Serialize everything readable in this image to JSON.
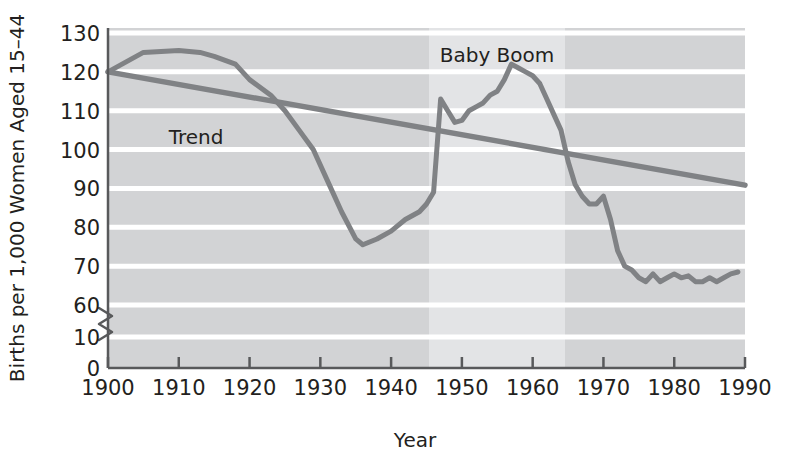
{
  "chart_data": {
    "type": "line",
    "title": "",
    "xlabel": "Year",
    "ylabel": "Births per 1,000 Women Aged 15–44",
    "xlim": [
      1900,
      1990
    ],
    "ylim": [
      0,
      130
    ],
    "y_axis_break": {
      "present": true,
      "between": [
        10,
        60
      ],
      "note": "zigzag break on y-axis"
    },
    "xticks": [
      1900,
      1910,
      1920,
      1930,
      1940,
      1950,
      1960,
      1970,
      1980,
      1990
    ],
    "xtick_labels": [
      "1900",
      "1910",
      "1920",
      "1930",
      "1940",
      "1950",
      "1960",
      "1970",
      "1980",
      "1990"
    ],
    "yticks": [
      0,
      10,
      60,
      70,
      80,
      90,
      100,
      110,
      120,
      130
    ],
    "ytick_labels": [
      "0",
      "10",
      "60",
      "70",
      "80",
      "90",
      "100",
      "110",
      "120",
      "130"
    ],
    "grid": "horizontal-white-lines",
    "legend": "none",
    "plot_background": "#d2d3d5",
    "band_background": "#e0e1e3",
    "line_color": "#808285",
    "annotations": [
      {
        "text": "Baby Boom",
        "x": 1955,
        "y": 128,
        "name": "baby-boom-label"
      },
      {
        "text": "Trend",
        "x": 1917,
        "y": 103,
        "name": "trend-label"
      }
    ],
    "shaded_region": {
      "name": "baby-boom-band",
      "x_start": 1946,
      "x_end": 1964,
      "color": "#e0e1e3"
    },
    "series": [
      {
        "name": "Birth rate",
        "color": "#808285",
        "x": [
          1900,
          1905,
          1910,
          1913,
          1915,
          1918,
          1920,
          1923,
          1925,
          1927,
          1929,
          1931,
          1933,
          1935,
          1936,
          1938,
          1940,
          1942,
          1944,
          1945,
          1946,
          1947,
          1948,
          1949,
          1950,
          1951,
          1952,
          1953,
          1954,
          1955,
          1956,
          1957,
          1958,
          1959,
          1960,
          1961,
          1962,
          1963,
          1964,
          1965,
          1966,
          1967,
          1968,
          1969,
          1970,
          1971,
          1972,
          1973,
          1974,
          1975,
          1976,
          1977,
          1978,
          1979,
          1980,
          1981,
          1982,
          1983,
          1984,
          1985,
          1986,
          1987,
          1988,
          1989
        ],
        "y": [
          120,
          125,
          125.5,
          125,
          124,
          122,
          118,
          114,
          110,
          105,
          100,
          92,
          84,
          77,
          75.5,
          77,
          79,
          82,
          84,
          86,
          89,
          113,
          110,
          107,
          107.5,
          110,
          111,
          112,
          114,
          115,
          118,
          122,
          121,
          120,
          119,
          117,
          113,
          109,
          105,
          97,
          91,
          88,
          86,
          86,
          88,
          82,
          74,
          70,
          69,
          67,
          66,
          68,
          66,
          67,
          68,
          67,
          67.5,
          66,
          66,
          67,
          66,
          67,
          68,
          68.5
        ]
      },
      {
        "name": "Trend",
        "color": "#808285",
        "x": [
          1900,
          1990
        ],
        "y": [
          120,
          59
        ]
      }
    ]
  },
  "axes": {
    "x_title": "Year",
    "y_title": "Births per 1,000 Women Aged 15–44"
  },
  "labels": {
    "baby_boom": "Baby Boom",
    "trend": "Trend"
  },
  "colors": {
    "plot_bg": "#d2d3d5",
    "band_bg": "#e0e1e3",
    "line": "#808285",
    "grid": "#ffffff",
    "axis": "#58595b",
    "text": "#231f20"
  }
}
